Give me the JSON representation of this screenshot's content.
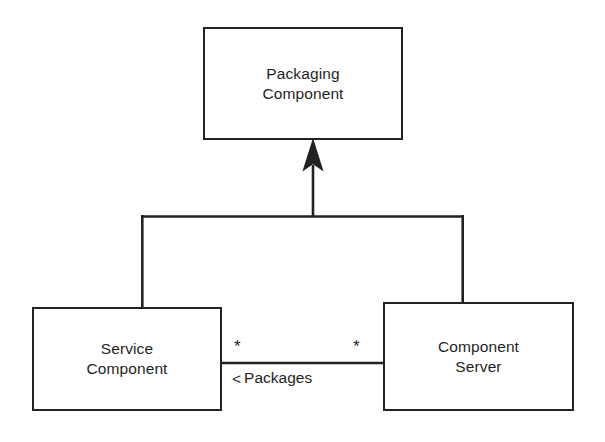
{
  "diagram": {
    "type": "uml-class-diagram",
    "background_color": "#ffffff",
    "line_color": "#222222",
    "text_color": "#1f1f1f",
    "classes": [
      {
        "id": "packaging-component",
        "name": "Packaging\nComponent",
        "name_line_1": "Packaging",
        "name_line_2": "Component"
      },
      {
        "id": "service-component",
        "name": "Service\nComponent",
        "name_line_1": "Service",
        "name_line_2": "Component"
      },
      {
        "id": "component-server",
        "name": "Component\nServer",
        "name_line_1": "Component",
        "name_line_2": "Server"
      }
    ],
    "relationships": [
      {
        "id": "generalization-tree",
        "kind": "generalization",
        "general": "Packaging Component",
        "specifics": [
          "Service Component",
          "Component Server"
        ],
        "arrowhead": "solid-closed-arrow",
        "style": "shared-tree"
      },
      {
        "id": "packages-association",
        "kind": "association",
        "source": "Service Component",
        "target": "Component Server",
        "label": "Packages",
        "direction_marker": "<",
        "direction_marker_name": "navigation-direction-triangle",
        "source_multiplicity": "*",
        "target_multiplicity": "*"
      }
    ]
  }
}
